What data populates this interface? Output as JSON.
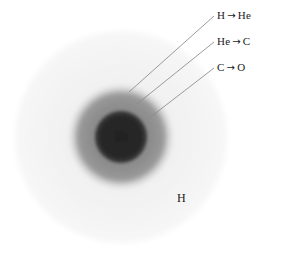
{
  "figure": {
    "center": {
      "x": 121,
      "y": 137
    },
    "background_color": "#ffffff",
    "layers": [
      {
        "name": "hydrogen-envelope",
        "label": "H",
        "radius": 109,
        "fill_color": "#f4f4f4",
        "edge_color": "#ececec"
      },
      {
        "name": "hydrogen-burning-shell",
        "label": "H → He",
        "radius": 53,
        "fill_color": "#a8a8a8",
        "edge_color": "#c7c7c7"
      },
      {
        "name": "helium-burning-shell",
        "label": "He → C",
        "radius": 45,
        "fill_color": "#8f8f8f",
        "edge_color": "#9e9e9e"
      },
      {
        "name": "carbon-oxygen-core",
        "label": "C → O",
        "radius": 27,
        "fill_color": "#2b2b2b",
        "edge_color": "#3a3a3a"
      }
    ]
  },
  "labels": {
    "h_to_he": {
      "reactant": "H",
      "arrow": "→",
      "product": "He"
    },
    "he_to_c": {
      "reactant": "He",
      "arrow": "→",
      "product": "C"
    },
    "c_to_o": {
      "reactant": "C",
      "arrow": "→",
      "product": "O"
    },
    "envelope": "H"
  },
  "leader_lines": [
    {
      "name": "leader-h-he",
      "x1": 214,
      "y1": 16,
      "x2": 129,
      "y2": 92,
      "color": "#888888"
    },
    {
      "name": "leader-he-c",
      "x1": 214,
      "y1": 42,
      "x2": 137,
      "y2": 104,
      "color": "#888888"
    },
    {
      "name": "leader-c-o",
      "x1": 214,
      "y1": 68,
      "x2": 148,
      "y2": 119,
      "color": "#888888"
    }
  ]
}
